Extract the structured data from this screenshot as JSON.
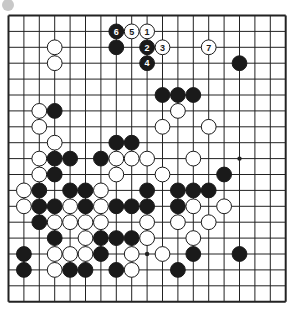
{
  "board": {
    "size": 19,
    "origin_x": 8.5,
    "origin_y": 15.5,
    "col_spacing": 15.4,
    "row_spacing": 15.9,
    "stone_radius": 7.4,
    "line_color": "#222222",
    "border_width": 2,
    "background": "#ffffff",
    "black_color": "#1a1a1a",
    "white_color": "#ffffff",
    "star_points": [
      [
        9,
        15
      ],
      [
        15,
        9
      ]
    ]
  },
  "corner_marker": {
    "cx": 8,
    "cy": 5,
    "r": 6,
    "color": "#c8c8c8"
  },
  "stones": [
    {
      "r": 1,
      "c": 7,
      "color": "black",
      "label": "6"
    },
    {
      "r": 1,
      "c": 8,
      "color": "white",
      "label": "5"
    },
    {
      "r": 1,
      "c": 9,
      "color": "white",
      "label": "1"
    },
    {
      "r": 2,
      "c": 3,
      "color": "white"
    },
    {
      "r": 2,
      "c": 7,
      "color": "black"
    },
    {
      "r": 2,
      "c": 9,
      "color": "black",
      "label": "2"
    },
    {
      "r": 2,
      "c": 10,
      "color": "white",
      "label": "3"
    },
    {
      "r": 2,
      "c": 13,
      "color": "white",
      "label": "7"
    },
    {
      "r": 3,
      "c": 3,
      "color": "white"
    },
    {
      "r": 3,
      "c": 9,
      "color": "black",
      "label": "4"
    },
    {
      "r": 3,
      "c": 15,
      "color": "black"
    },
    {
      "r": 5,
      "c": 10,
      "color": "black"
    },
    {
      "r": 5,
      "c": 11,
      "color": "black"
    },
    {
      "r": 5,
      "c": 12,
      "color": "black"
    },
    {
      "r": 6,
      "c": 2,
      "color": "white"
    },
    {
      "r": 6,
      "c": 3,
      "color": "black"
    },
    {
      "r": 6,
      "c": 11,
      "color": "white"
    },
    {
      "r": 7,
      "c": 2,
      "color": "white"
    },
    {
      "r": 7,
      "c": 10,
      "color": "white"
    },
    {
      "r": 7,
      "c": 13,
      "color": "white"
    },
    {
      "r": 8,
      "c": 3,
      "color": "white"
    },
    {
      "r": 8,
      "c": 7,
      "color": "black"
    },
    {
      "r": 8,
      "c": 8,
      "color": "black"
    },
    {
      "r": 9,
      "c": 2,
      "color": "white"
    },
    {
      "r": 9,
      "c": 3,
      "color": "black"
    },
    {
      "r": 9,
      "c": 4,
      "color": "black"
    },
    {
      "r": 9,
      "c": 6,
      "color": "black"
    },
    {
      "r": 9,
      "c": 7,
      "color": "white"
    },
    {
      "r": 9,
      "c": 8,
      "color": "white"
    },
    {
      "r": 9,
      "c": 9,
      "color": "white"
    },
    {
      "r": 9,
      "c": 12,
      "color": "white"
    },
    {
      "r": 10,
      "c": 2,
      "color": "white"
    },
    {
      "r": 10,
      "c": 3,
      "color": "black"
    },
    {
      "r": 10,
      "c": 7,
      "color": "white"
    },
    {
      "r": 10,
      "c": 10,
      "color": "white"
    },
    {
      "r": 10,
      "c": 14,
      "color": "black"
    },
    {
      "r": 11,
      "c": 1,
      "color": "white"
    },
    {
      "r": 11,
      "c": 2,
      "color": "black"
    },
    {
      "r": 11,
      "c": 4,
      "color": "black"
    },
    {
      "r": 11,
      "c": 5,
      "color": "black"
    },
    {
      "r": 11,
      "c": 6,
      "color": "white"
    },
    {
      "r": 11,
      "c": 9,
      "color": "black"
    },
    {
      "r": 11,
      "c": 11,
      "color": "black"
    },
    {
      "r": 11,
      "c": 12,
      "color": "black"
    },
    {
      "r": 11,
      "c": 13,
      "color": "black"
    },
    {
      "r": 12,
      "c": 1,
      "color": "white"
    },
    {
      "r": 12,
      "c": 2,
      "color": "black"
    },
    {
      "r": 12,
      "c": 3,
      "color": "black"
    },
    {
      "r": 12,
      "c": 4,
      "color": "white"
    },
    {
      "r": 12,
      "c": 5,
      "color": "black"
    },
    {
      "r": 12,
      "c": 6,
      "color": "white"
    },
    {
      "r": 12,
      "c": 7,
      "color": "black"
    },
    {
      "r": 12,
      "c": 8,
      "color": "black"
    },
    {
      "r": 12,
      "c": 9,
      "color": "black"
    },
    {
      "r": 12,
      "c": 11,
      "color": "black"
    },
    {
      "r": 12,
      "c": 12,
      "color": "white"
    },
    {
      "r": 12,
      "c": 14,
      "color": "white"
    },
    {
      "r": 13,
      "c": 2,
      "color": "black"
    },
    {
      "r": 13,
      "c": 3,
      "color": "white"
    },
    {
      "r": 13,
      "c": 4,
      "color": "white"
    },
    {
      "r": 13,
      "c": 5,
      "color": "white"
    },
    {
      "r": 13,
      "c": 6,
      "color": "white"
    },
    {
      "r": 13,
      "c": 9,
      "color": "white"
    },
    {
      "r": 13,
      "c": 11,
      "color": "white"
    },
    {
      "r": 13,
      "c": 13,
      "color": "white"
    },
    {
      "r": 14,
      "c": 3,
      "color": "black"
    },
    {
      "r": 14,
      "c": 5,
      "color": "white"
    },
    {
      "r": 14,
      "c": 6,
      "color": "black"
    },
    {
      "r": 14,
      "c": 7,
      "color": "black"
    },
    {
      "r": 14,
      "c": 8,
      "color": "black"
    },
    {
      "r": 14,
      "c": 9,
      "color": "white"
    },
    {
      "r": 14,
      "c": 12,
      "color": "white"
    },
    {
      "r": 15,
      "c": 1,
      "color": "black"
    },
    {
      "r": 15,
      "c": 3,
      "color": "white"
    },
    {
      "r": 15,
      "c": 4,
      "color": "white"
    },
    {
      "r": 15,
      "c": 5,
      "color": "white"
    },
    {
      "r": 15,
      "c": 6,
      "color": "black"
    },
    {
      "r": 15,
      "c": 8,
      "color": "white"
    },
    {
      "r": 15,
      "c": 10,
      "color": "white"
    },
    {
      "r": 15,
      "c": 12,
      "color": "black"
    },
    {
      "r": 15,
      "c": 15,
      "color": "black"
    },
    {
      "r": 16,
      "c": 1,
      "color": "black"
    },
    {
      "r": 16,
      "c": 3,
      "color": "white"
    },
    {
      "r": 16,
      "c": 4,
      "color": "black"
    },
    {
      "r": 16,
      "c": 5,
      "color": "black"
    },
    {
      "r": 16,
      "c": 7,
      "color": "black"
    },
    {
      "r": 16,
      "c": 8,
      "color": "white"
    },
    {
      "r": 16,
      "c": 11,
      "color": "black"
    }
  ]
}
